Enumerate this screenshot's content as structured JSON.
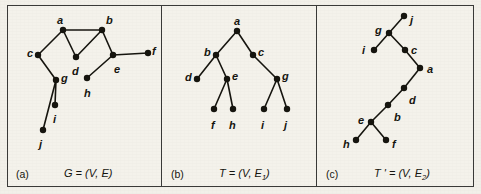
{
  "figure": {
    "width": 481,
    "height": 194,
    "background_color": "#f2f0e9",
    "ink_color": "#16150f",
    "frame_color": "#3a3a38",
    "node_radius": 3.2,
    "edge_width": 1.6
  },
  "panels": [
    {
      "id": "a",
      "tag": "(a)",
      "tag_pos": {
        "x": 16,
        "y": 168
      },
      "caption_text": "G = (V, E)",
      "caption_pos": {
        "x": 64,
        "y": 167
      },
      "nodes": [
        {
          "id": "a",
          "x": 63,
          "y": 30,
          "label": "a",
          "label_x": 57,
          "label_y": 15
        },
        {
          "id": "b",
          "x": 102,
          "y": 30,
          "label": "b",
          "label_x": 106,
          "label_y": 15
        },
        {
          "id": "c",
          "x": 38,
          "y": 55,
          "label": "c",
          "label_x": 27,
          "label_y": 48
        },
        {
          "id": "d",
          "x": 76,
          "y": 57,
          "label": "d",
          "label_x": 72,
          "label_y": 66
        },
        {
          "id": "e",
          "x": 113,
          "y": 55,
          "label": "e",
          "label_x": 114,
          "label_y": 64
        },
        {
          "id": "f",
          "x": 148,
          "y": 53,
          "label": "f",
          "label_x": 152,
          "label_y": 46
        },
        {
          "id": "g",
          "x": 56,
          "y": 80,
          "label": "g",
          "label_x": 61,
          "label_y": 73
        },
        {
          "id": "h",
          "x": 87,
          "y": 78,
          "label": "h",
          "label_x": 84,
          "label_y": 88
        },
        {
          "id": "i",
          "x": 55,
          "y": 105,
          "label": "i",
          "label_x": 53,
          "label_y": 114
        },
        {
          "id": "j",
          "x": 43,
          "y": 130,
          "label": "j",
          "label_x": 39,
          "label_y": 139
        }
      ],
      "edges": [
        [
          "a",
          "b"
        ],
        [
          "a",
          "c"
        ],
        [
          "a",
          "d"
        ],
        [
          "b",
          "d"
        ],
        [
          "b",
          "e"
        ],
        [
          "e",
          "f"
        ],
        [
          "e",
          "h"
        ],
        [
          "c",
          "g"
        ],
        [
          "g",
          "i"
        ],
        [
          "g",
          "j"
        ]
      ]
    },
    {
      "id": "b",
      "tag": "(b)",
      "tag_pos": {
        "x": 171,
        "y": 168
      },
      "caption_text": "T = (V, E1)",
      "caption_pos": {
        "x": 219,
        "y": 167
      },
      "nodes": [
        {
          "id": "a",
          "x": 237,
          "y": 31,
          "label": "a",
          "label_x": 234,
          "label_y": 16
        },
        {
          "id": "b",
          "x": 216,
          "y": 55,
          "label": "b",
          "label_x": 204,
          "label_y": 47
        },
        {
          "id": "c",
          "x": 253,
          "y": 55,
          "label": "c",
          "label_x": 258,
          "label_y": 47
        },
        {
          "id": "d",
          "x": 197,
          "y": 79,
          "label": "d",
          "label_x": 185,
          "label_y": 72
        },
        {
          "id": "e",
          "x": 227,
          "y": 79,
          "label": "e",
          "label_x": 232,
          "label_y": 71
        },
        {
          "id": "g",
          "x": 277,
          "y": 79,
          "label": "g",
          "label_x": 282,
          "label_y": 71
        },
        {
          "id": "f",
          "x": 214,
          "y": 109,
          "label": "f",
          "label_x": 211,
          "label_y": 120
        },
        {
          "id": "h",
          "x": 233,
          "y": 109,
          "label": "h",
          "label_x": 229,
          "label_y": 120
        },
        {
          "id": "i",
          "x": 264,
          "y": 109,
          "label": "i",
          "label_x": 261,
          "label_y": 120
        },
        {
          "id": "j",
          "x": 287,
          "y": 109,
          "label": "j",
          "label_x": 284,
          "label_y": 120
        }
      ],
      "edges": [
        [
          "a",
          "b"
        ],
        [
          "a",
          "c"
        ],
        [
          "b",
          "d"
        ],
        [
          "b",
          "e"
        ],
        [
          "c",
          "g"
        ],
        [
          "e",
          "f"
        ],
        [
          "e",
          "h"
        ],
        [
          "g",
          "i"
        ],
        [
          "g",
          "j"
        ]
      ]
    },
    {
      "id": "c",
      "tag": "(c)",
      "tag_pos": {
        "x": 326,
        "y": 168
      },
      "caption_text": "T ' = (V, E2)",
      "caption_pos": {
        "x": 374,
        "y": 167
      },
      "nodes": [
        {
          "id": "j",
          "x": 404,
          "y": 16,
          "label": "j",
          "label_x": 410,
          "label_y": 15
        },
        {
          "id": "g",
          "x": 389,
          "y": 33,
          "label": "g",
          "label_x": 375,
          "label_y": 25
        },
        {
          "id": "i",
          "x": 374,
          "y": 50,
          "label": "i",
          "label_x": 362,
          "label_y": 45
        },
        {
          "id": "c",
          "x": 405,
          "y": 50,
          "label": "c",
          "label_x": 411,
          "label_y": 45
        },
        {
          "id": "a",
          "x": 420,
          "y": 68,
          "label": "a",
          "label_x": 427,
          "label_y": 64
        },
        {
          "id": "d",
          "x": 404,
          "y": 88,
          "label": "d",
          "label_x": 409,
          "label_y": 95
        },
        {
          "id": "b",
          "x": 388,
          "y": 105,
          "label": "b",
          "label_x": 394,
          "label_y": 112
        },
        {
          "id": "e",
          "x": 371,
          "y": 122,
          "label": "e",
          "label_x": 358,
          "label_y": 115
        },
        {
          "id": "h",
          "x": 356,
          "y": 140,
          "label": "h",
          "label_x": 343,
          "label_y": 139
        },
        {
          "id": "f",
          "x": 386,
          "y": 140,
          "label": "f",
          "label_x": 392,
          "label_y": 139
        }
      ],
      "edges": [
        [
          "j",
          "g"
        ],
        [
          "g",
          "i"
        ],
        [
          "g",
          "c"
        ],
        [
          "c",
          "a"
        ],
        [
          "a",
          "d"
        ],
        [
          "d",
          "b"
        ],
        [
          "b",
          "e"
        ],
        [
          "e",
          "h"
        ],
        [
          "e",
          "f"
        ]
      ]
    }
  ]
}
